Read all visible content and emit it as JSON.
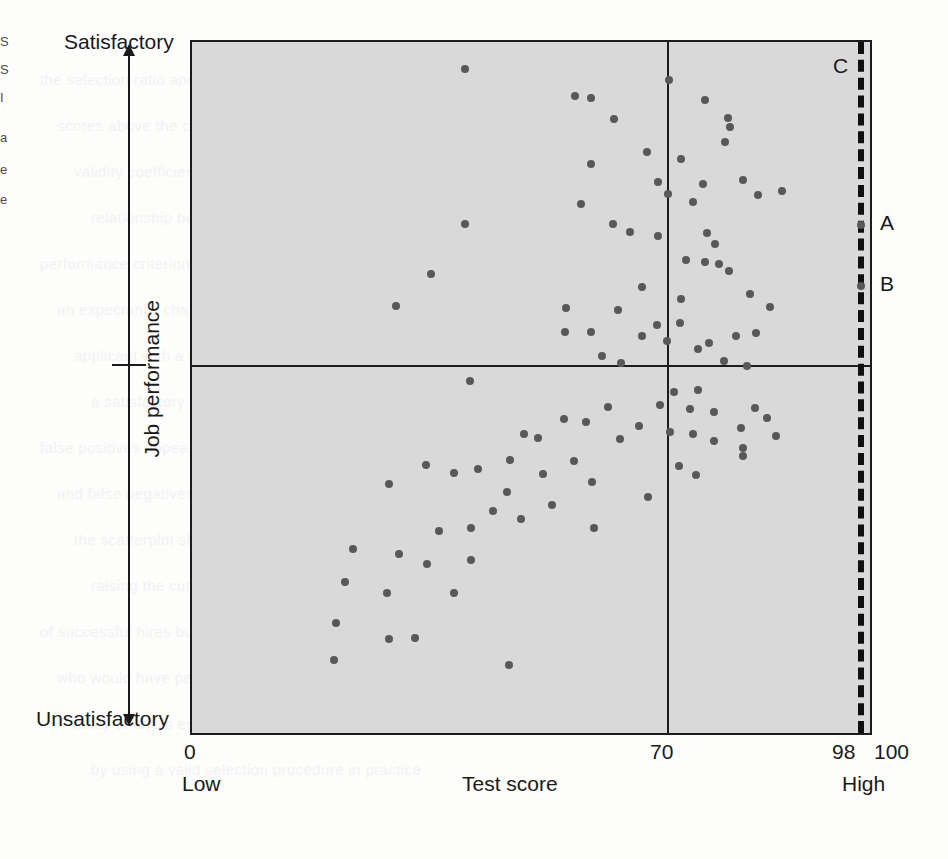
{
  "chart_data": {
    "type": "scatter",
    "title": "",
    "xlabel": "Test score",
    "ylabel": "Job performance",
    "xlim": [
      0,
      100
    ],
    "ylim": [
      0,
      100
    ],
    "grid": false,
    "legend": "none",
    "x_axis": {
      "ticks": [
        {
          "value": 0,
          "label": "0"
        },
        {
          "value": 70,
          "label": "70"
        },
        {
          "value": 98,
          "label": "98"
        },
        {
          "value": 100,
          "label": "100"
        }
      ],
      "endpoint_labels": {
        "left": "Low",
        "right": "High"
      }
    },
    "y_axis": {
      "endpoint_labels": {
        "top": "Satisfactory",
        "bottom": "Unsatisfactory"
      },
      "midline_value": 50
    },
    "reference_lines": [
      {
        "name": "cutoff-score-line",
        "orientation": "vertical",
        "value": 70,
        "style": "solid",
        "label": ""
      },
      {
        "name": "performance-midline",
        "orientation": "horizontal",
        "value": 50,
        "style": "solid",
        "label": ""
      },
      {
        "name": "selection-cutoff-line",
        "orientation": "vertical",
        "value": 98,
        "style": "dashed",
        "label": "C"
      }
    ],
    "annotations": [
      {
        "name": "annotation-C",
        "label": "C",
        "x": 97,
        "y": 97
      },
      {
        "name": "annotation-A",
        "label": "A",
        "x": 98.7,
        "y": 73.5
      },
      {
        "name": "annotation-B",
        "label": "B",
        "x": 98.7,
        "y": 64.7
      }
    ],
    "points": [
      {
        "x": 40.3,
        "y": 96.1
      },
      {
        "x": 56.5,
        "y": 92.2
      },
      {
        "x": 58.9,
        "y": 91.9
      },
      {
        "x": 70.3,
        "y": 94.5
      },
      {
        "x": 62.3,
        "y": 88.9
      },
      {
        "x": 79.3,
        "y": 87.7
      },
      {
        "x": 75.7,
        "y": 91.6
      },
      {
        "x": 79.1,
        "y": 89.0
      },
      {
        "x": 72.1,
        "y": 83.1
      },
      {
        "x": 58.9,
        "y": 82.4
      },
      {
        "x": 67.1,
        "y": 84.1
      },
      {
        "x": 68.7,
        "y": 79.8
      },
      {
        "x": 78.6,
        "y": 85.6
      },
      {
        "x": 81.3,
        "y": 80.1
      },
      {
        "x": 83.5,
        "y": 77.9
      },
      {
        "x": 75.4,
        "y": 79.5
      },
      {
        "x": 40.3,
        "y": 73.6
      },
      {
        "x": 57.4,
        "y": 76.6
      },
      {
        "x": 70.2,
        "y": 78.0
      },
      {
        "x": 73.9,
        "y": 76.8
      },
      {
        "x": 87.0,
        "y": 78.5
      },
      {
        "x": 62.1,
        "y": 73.6
      },
      {
        "x": 64.6,
        "y": 72.5
      },
      {
        "x": 68.8,
        "y": 71.9
      },
      {
        "x": 76.0,
        "y": 72.4
      },
      {
        "x": 77.1,
        "y": 70.8
      },
      {
        "x": 72.9,
        "y": 68.4
      },
      {
        "x": 75.6,
        "y": 68.1
      },
      {
        "x": 77.8,
        "y": 67.9
      },
      {
        "x": 35.3,
        "y": 66.4
      },
      {
        "x": 79.2,
        "y": 66.8
      },
      {
        "x": 98.7,
        "y": 73.5
      },
      {
        "x": 66.4,
        "y": 64.5
      },
      {
        "x": 72.1,
        "y": 62.8
      },
      {
        "x": 82.3,
        "y": 63.6
      },
      {
        "x": 98.7,
        "y": 64.7
      },
      {
        "x": 30.1,
        "y": 61.8
      },
      {
        "x": 55.1,
        "y": 61.5
      },
      {
        "x": 72.0,
        "y": 59.3
      },
      {
        "x": 62.9,
        "y": 61.2
      },
      {
        "x": 68.6,
        "y": 59.0
      },
      {
        "x": 85.2,
        "y": 61.6
      },
      {
        "x": 80.3,
        "y": 57.5
      },
      {
        "x": 55.0,
        "y": 58.1
      },
      {
        "x": 58.8,
        "y": 58.0
      },
      {
        "x": 66.4,
        "y": 57.5
      },
      {
        "x": 83.2,
        "y": 57.9
      },
      {
        "x": 70.0,
        "y": 56.8
      },
      {
        "x": 74.7,
        "y": 55.6
      },
      {
        "x": 76.3,
        "y": 56.4
      },
      {
        "x": 60.4,
        "y": 54.5
      },
      {
        "x": 63.3,
        "y": 53.6
      },
      {
        "x": 78.5,
        "y": 53.9
      },
      {
        "x": 81.9,
        "y": 53.1
      },
      {
        "x": 41.0,
        "y": 51.0
      },
      {
        "x": 74.6,
        "y": 49.6
      },
      {
        "x": 61.3,
        "y": 47.2
      },
      {
        "x": 69.1,
        "y": 47.5
      },
      {
        "x": 73.5,
        "y": 46.9
      },
      {
        "x": 77.0,
        "y": 46.5
      },
      {
        "x": 83.1,
        "y": 47.0
      },
      {
        "x": 84.8,
        "y": 45.6
      },
      {
        "x": 54.9,
        "y": 45.4
      },
      {
        "x": 58.1,
        "y": 45.0
      },
      {
        "x": 66.0,
        "y": 44.5
      },
      {
        "x": 80.9,
        "y": 44.2
      },
      {
        "x": 49.0,
        "y": 43.3
      },
      {
        "x": 70.5,
        "y": 43.6
      },
      {
        "x": 51.0,
        "y": 42.7
      },
      {
        "x": 63.2,
        "y": 42.5
      },
      {
        "x": 73.9,
        "y": 43.2
      },
      {
        "x": 77.0,
        "y": 42.3
      },
      {
        "x": 86.1,
        "y": 43.0
      },
      {
        "x": 81.3,
        "y": 41.3
      },
      {
        "x": 81.2,
        "y": 40.1
      },
      {
        "x": 46.9,
        "y": 39.5
      },
      {
        "x": 56.3,
        "y": 39.3
      },
      {
        "x": 34.5,
        "y": 38.8
      },
      {
        "x": 42.2,
        "y": 38.2
      },
      {
        "x": 71.9,
        "y": 38.6
      },
      {
        "x": 38.6,
        "y": 37.6
      },
      {
        "x": 51.8,
        "y": 37.5
      },
      {
        "x": 74.3,
        "y": 37.4
      },
      {
        "x": 59.0,
        "y": 36.3
      },
      {
        "x": 46.5,
        "y": 34.9
      },
      {
        "x": 29.1,
        "y": 36.1
      },
      {
        "x": 67.2,
        "y": 34.2
      },
      {
        "x": 44.4,
        "y": 32.1
      },
      {
        "x": 53.1,
        "y": 33.0
      },
      {
        "x": 48.5,
        "y": 31.0
      },
      {
        "x": 41.1,
        "y": 29.7
      },
      {
        "x": 36.4,
        "y": 29.2
      },
      {
        "x": 59.3,
        "y": 29.7
      },
      {
        "x": 23.8,
        "y": 26.7
      },
      {
        "x": 30.6,
        "y": 25.9
      },
      {
        "x": 41.2,
        "y": 25.0
      },
      {
        "x": 34.7,
        "y": 24.4
      },
      {
        "x": 22.5,
        "y": 21.9
      },
      {
        "x": 28.8,
        "y": 20.3
      },
      {
        "x": 38.7,
        "y": 20.2
      },
      {
        "x": 21.2,
        "y": 15.9
      },
      {
        "x": 29.1,
        "y": 13.6
      },
      {
        "x": 32.9,
        "y": 13.7
      },
      {
        "x": 21.0,
        "y": 10.6
      },
      {
        "x": 46.7,
        "y": 9.9
      },
      {
        "x": 71.1,
        "y": 49.4
      }
    ]
  },
  "margin_fragments": [
    "S",
    "S",
    "I",
    "a",
    "e",
    "e"
  ],
  "ghost_text": [
    "the selection ratio and the base rate of success",
    "scores above the cutoff are predicted to succeed",
    "validity coefficient indicates the strength of the",
    "relationship between the test score and the job",
    "performance criterion measured for each person",
    "an expectancy chart shows the probability that an",
    "applicant with a given test score will perform at",
    "a satisfactory level on the job after being hired",
    "false positives appear in the lower right quadrant",
    "and false negatives in the upper left quadrant of",
    "the scatterplot shown in the figure on this page",
    "raising the cutoff score increases the proportion",
    "of successful hires but rejects some applicants",
    "who would have performed satisfactorily at work",
    "utility analysis estimates the dollar value gained",
    "by using a valid selection procedure in practice"
  ]
}
